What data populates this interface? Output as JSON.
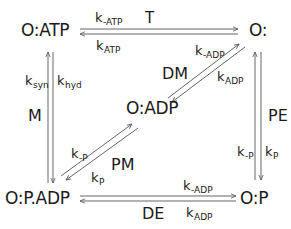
{
  "diagram": {
    "type": "kinetic-scheme",
    "colors": {
      "text": "#1a1a1a",
      "arrow": "#555555",
      "background": "#ffffff"
    },
    "nodes": {
      "o_atp": "O:ATP",
      "o": "O:",
      "o_adp": "O:ADP",
      "o_p_adp": "O:P.ADP",
      "o_p": "O:P"
    },
    "transitions": {
      "T": {
        "label": "T",
        "from": "O:ATP",
        "to": "O:",
        "forward": {
          "k": "k",
          "sub": "-ATP"
        },
        "reverse": {
          "k": "k",
          "sub": "ATP"
        }
      },
      "M": {
        "label": "M",
        "from": "O:ATP",
        "to": "O:P.ADP",
        "forward": {
          "k": "k",
          "sub": "hyd"
        },
        "reverse": {
          "k": "k",
          "sub": "syn"
        }
      },
      "DM": {
        "label": "DM",
        "from": "O:ADP",
        "to": "O:",
        "forward": {
          "k": "k",
          "sub": "-ADP"
        },
        "reverse": {
          "k": "k",
          "sub": "ADP"
        }
      },
      "PM": {
        "label": "PM",
        "from": "O:P.ADP",
        "to": "O:ADP",
        "forward": {
          "k": "k",
          "sub": "-P"
        },
        "reverse": {
          "k": "k",
          "sub": "P"
        }
      },
      "PE": {
        "label": "PE",
        "from": "O:",
        "to": "O:P",
        "forward": {
          "k": "k",
          "sub": "P"
        },
        "reverse": {
          "k": "k",
          "sub": "-P"
        }
      },
      "DE": {
        "label": "DE",
        "from": "O:P.ADP",
        "to": "O:P",
        "forward": {
          "k": "k",
          "sub": "-ADP"
        },
        "reverse": {
          "k": "k",
          "sub": "ADP"
        }
      }
    }
  }
}
